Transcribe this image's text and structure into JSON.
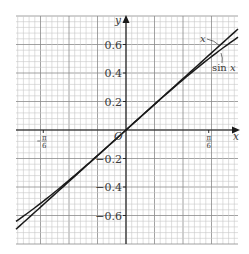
{
  "chart_data": {
    "type": "line",
    "title": "",
    "xlabel": "x",
    "ylabel": "y",
    "origin_label": "O",
    "xlim": [
      -0.696,
      0.709
    ],
    "ylim": [
      -0.8,
      0.8
    ],
    "x_ticks": [
      {
        "value": -0.5236,
        "label_num": "π",
        "label_den": "6",
        "sign": "−"
      },
      {
        "value": 0.5236,
        "label_num": "π",
        "label_den": "6",
        "sign": ""
      }
    ],
    "y_ticks": [
      {
        "value": 0.6,
        "label": "0.6"
      },
      {
        "value": 0.4,
        "label": "0.4"
      },
      {
        "value": 0.2,
        "label": "0.2"
      },
      {
        "value": -0.2,
        "label": "−0.2"
      },
      {
        "value": -0.4,
        "label": "−0.4"
      },
      {
        "value": -0.6,
        "label": "−0.6"
      }
    ],
    "grid": true,
    "series": [
      {
        "name": "x",
        "label": "x",
        "function": "y = x",
        "x": [
          -0.696,
          -0.5236,
          -0.3,
          0,
          0.3,
          0.5236,
          0.709
        ],
        "y": [
          -0.696,
          -0.5236,
          -0.3,
          0,
          0.3,
          0.5236,
          0.709
        ]
      },
      {
        "name": "sin x",
        "label": "sin x",
        "function": "y = sin x",
        "x": [
          -0.696,
          -0.5236,
          -0.3,
          0,
          0.3,
          0.5236,
          0.709
        ],
        "y": [
          -0.641,
          -0.5,
          -0.296,
          0,
          0.296,
          0.5,
          0.651
        ]
      }
    ]
  },
  "colors": {
    "grid_minor": "#c8c8c8",
    "grid_major": "#8a8a8a",
    "axis": "#1a1a1a",
    "curve": "#1a1a1a",
    "label": "#3a3a3a"
  }
}
